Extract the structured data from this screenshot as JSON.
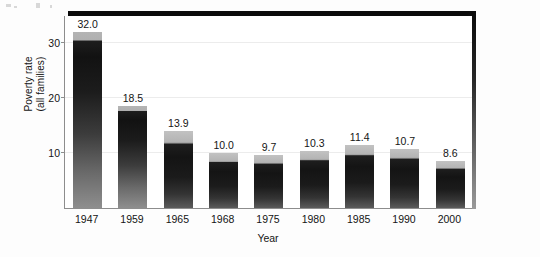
{
  "chart_data": {
    "type": "bar",
    "title": "",
    "subtitle": "",
    "xlabel": "Year",
    "ylabel_line1": "Poverty rate",
    "ylabel_line2": "(all families)",
    "categories": [
      "1947",
      "1959",
      "1965",
      "1968",
      "1975",
      "1980",
      "1985",
      "1990",
      "2000"
    ],
    "values": [
      32.0,
      18.5,
      13.9,
      10.0,
      9.7,
      10.3,
      11.4,
      10.7,
      8.6
    ],
    "value_labels": [
      "32.0",
      "18.5",
      "13.9",
      "10.0",
      "9.7",
      "10.3",
      "11.4",
      "10.7",
      "8.6"
    ],
    "yticks": [
      10,
      20,
      30
    ],
    "ytick_labels": [
      "10",
      "20",
      "30"
    ],
    "ylim": [
      0,
      35
    ],
    "grid": "horizontal",
    "legend": "none",
    "series": [
      {
        "name": "Poverty rate (all families)",
        "values": [
          32.0,
          18.5,
          13.9,
          10.0,
          9.7,
          10.3,
          11.4,
          10.7,
          8.6
        ]
      }
    ]
  },
  "style": {
    "bar_dark": "#121212",
    "bar_light": "#b4b4b4",
    "frame_color": "#0b0b0b",
    "axis_color": "#8d8d8d",
    "grid_color": "#ececec",
    "background": "#fdfdfd",
    "text_color": "#151515"
  }
}
